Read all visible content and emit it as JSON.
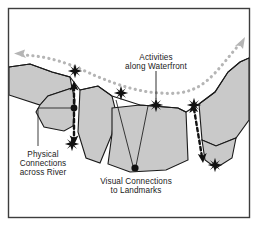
{
  "figure": {
    "frame_color": "#3d3d3d",
    "background_color": "#ffffff",
    "land_fill_color": "#c9c9c9",
    "land_stroke_color": "#1a1a1a",
    "water_fill_color": "#ffffff",
    "promenade_path_color": "#b5b5b5",
    "connection_arrow_color": "#111111",
    "marker_color": "#111111",
    "leader_line_color": "#1a1a1a"
  },
  "annotations": {
    "activities": {
      "line1": "Activities",
      "line2": "along Waterfront",
      "icon": "star-marker"
    },
    "physical": {
      "line1": "Physical",
      "line2": "Connections",
      "line3": "across River",
      "icon": "double-arrow-dashed"
    },
    "visual": {
      "line1": "Visual Connections",
      "line2": "to Landmarks",
      "icon": "sight-line"
    }
  },
  "legend_counts": {
    "star_markers": 6,
    "bridge_arrows": 2,
    "sight_lines": 2,
    "promenade_arrowheads": 2
  }
}
